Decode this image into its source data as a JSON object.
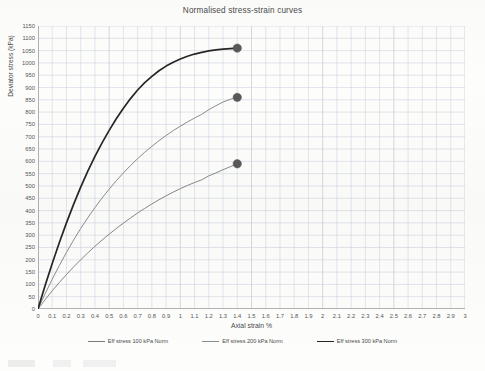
{
  "chart_data": {
    "type": "line",
    "title": "Normalised stress-strain curves",
    "xlabel": "Axial strain %",
    "ylabel": "Deviator stress (kPa)",
    "xlim": [
      0,
      3
    ],
    "ylim": [
      0,
      1150
    ],
    "xtick_step": 0.1,
    "ytick_step": 50,
    "grid": true,
    "legend_position": "bottom",
    "xticks": [
      "0",
      "0.1",
      "0.2",
      "0.3",
      "0.4",
      "0.5",
      "0.6",
      "0.7",
      "0.8",
      "0.9",
      "1",
      "1.1",
      "1.2",
      "1.3",
      "1.4",
      "1.5",
      "1.6",
      "1.7",
      "1.8",
      "1.9",
      "2",
      "2.1",
      "2.2",
      "2.3",
      "2.4",
      "2.5",
      "2.6",
      "2.7",
      "2.8",
      "2.9",
      "3"
    ],
    "yticks": [
      "0",
      "50",
      "100",
      "150",
      "200",
      "250",
      "300",
      "350",
      "400",
      "450",
      "500",
      "550",
      "600",
      "650",
      "700",
      "750",
      "800",
      "850",
      "900",
      "950",
      "1000",
      "1050",
      "1100",
      "1150"
    ],
    "series": [
      {
        "name": "Eff stress 100 kPa Norm",
        "color": "#7a7a7a",
        "width": 0.9,
        "endpoint_marker": true,
        "endpoint": [
          1.4,
          590
        ],
        "x": [
          0,
          0.05,
          0.1,
          0.15,
          0.2,
          0.25,
          0.3,
          0.35,
          0.4,
          0.45,
          0.5,
          0.55,
          0.6,
          0.65,
          0.7,
          0.75,
          0.8,
          0.85,
          0.9,
          0.95,
          1,
          1.05,
          1.1,
          1.15,
          1.2,
          1.25,
          1.3,
          1.35,
          1.4
        ],
        "y": [
          0,
          38,
          74,
          108,
          140,
          171,
          200,
          228,
          255,
          280,
          304,
          327,
          349,
          370,
          390,
          409,
          427,
          444,
          460,
          475,
          489,
          502,
          514,
          525,
          541,
          553,
          566,
          578,
          590
        ]
      },
      {
        "name": "Eff stress 200 kPa Norm",
        "color": "#8c8c8c",
        "width": 1.0,
        "endpoint_marker": true,
        "endpoint": [
          1.4,
          860
        ],
        "x": [
          0,
          0.05,
          0.1,
          0.15,
          0.2,
          0.25,
          0.3,
          0.35,
          0.4,
          0.45,
          0.5,
          0.55,
          0.6,
          0.65,
          0.7,
          0.75,
          0.8,
          0.85,
          0.9,
          0.95,
          1,
          1.05,
          1.1,
          1.15,
          1.2,
          1.25,
          1.3,
          1.35,
          1.4
        ],
        "y": [
          0,
          62,
          121,
          177,
          230,
          280,
          327,
          371,
          412,
          451,
          487,
          521,
          553,
          583,
          611,
          637,
          661,
          684,
          705,
          725,
          743,
          760,
          776,
          791,
          810,
          826,
          841,
          852,
          860
        ]
      },
      {
        "name": "Eff stress 300 kPa Norm",
        "color": "#262626",
        "width": 1.7,
        "endpoint_marker": true,
        "endpoint": [
          1.4,
          1060
        ],
        "x": [
          0,
          0.05,
          0.1,
          0.15,
          0.2,
          0.25,
          0.3,
          0.35,
          0.4,
          0.45,
          0.5,
          0.55,
          0.6,
          0.65,
          0.7,
          0.75,
          0.8,
          0.85,
          0.9,
          0.95,
          1,
          1.05,
          1.1,
          1.15,
          1.2,
          1.25,
          1.3,
          1.35,
          1.4
        ],
        "y": [
          0,
          95,
          185,
          270,
          350,
          425,
          495,
          560,
          620,
          675,
          726,
          773,
          816,
          855,
          890,
          920,
          945,
          968,
          987,
          1003,
          1016,
          1027,
          1036,
          1043,
          1049,
          1053,
          1056,
          1058,
          1060
        ]
      }
    ],
    "marker": {
      "shape": "circle",
      "color": "#595959",
      "radius": 4.2
    }
  }
}
